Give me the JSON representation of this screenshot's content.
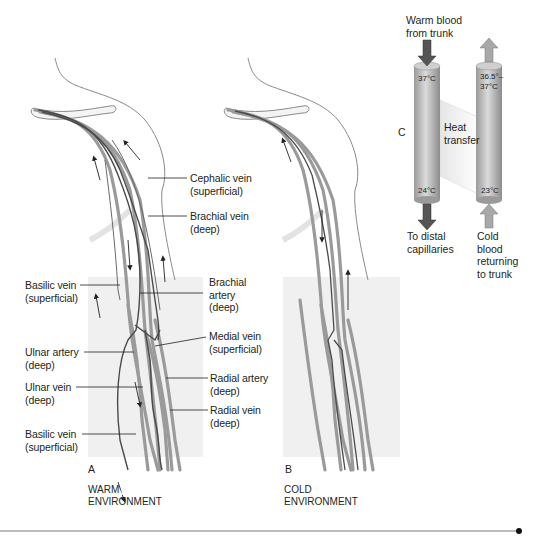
{
  "figure": {
    "panel_a": {
      "letter": "A",
      "environment": [
        "WARM",
        "ENVIRONMENT"
      ],
      "labels": {
        "cephalic_vein": [
          "Cephalic vein",
          "(superficial)"
        ],
        "brachial_vein": [
          "Brachial vein",
          "(deep)"
        ],
        "brachial_artery": [
          "Brachial",
          "artery",
          "(deep)"
        ],
        "medial_vein": [
          "Medial vein",
          "(superficial)"
        ],
        "radial_artery": [
          "Radial artery",
          "(deep)"
        ],
        "radial_vein": [
          "Radial vein",
          "(deep)"
        ],
        "basilic_vein_upper": [
          "Basilic vein",
          "(superficial)"
        ],
        "ulnar_artery": [
          "Ulnar artery",
          "(deep)"
        ],
        "ulnar_vein": [
          "Ulnar vein",
          "(deep)"
        ],
        "basilic_vein_lower": [
          "Basilic vein",
          "(superficial)"
        ]
      }
    },
    "panel_b": {
      "letter": "B",
      "environment": [
        "COLD",
        "ENVIRONMENT"
      ]
    },
    "panel_c": {
      "letter": "C",
      "warm_in": [
        "Warm blood",
        "from trunk"
      ],
      "to_distal": [
        "To distal",
        "capillaries"
      ],
      "cold_return": [
        "Cold",
        "blood",
        "returning",
        "to trunk"
      ],
      "heat_transfer": [
        "Heat",
        "transfer"
      ],
      "artery_top_temp": "37°C",
      "artery_bottom_temp": "24°C",
      "vein_top_temp": [
        "36.5°–",
        "37°C"
      ],
      "vein_bottom_temp": "23°C"
    },
    "colors": {
      "vessel_dark": "#4a4a4a",
      "vessel_light": "#9a9a9a",
      "panel_bg": "#f0f0f0",
      "tube": "#b5b5b5",
      "arrow_dark": "#555555",
      "arrow_light": "#a8a8a8"
    }
  }
}
